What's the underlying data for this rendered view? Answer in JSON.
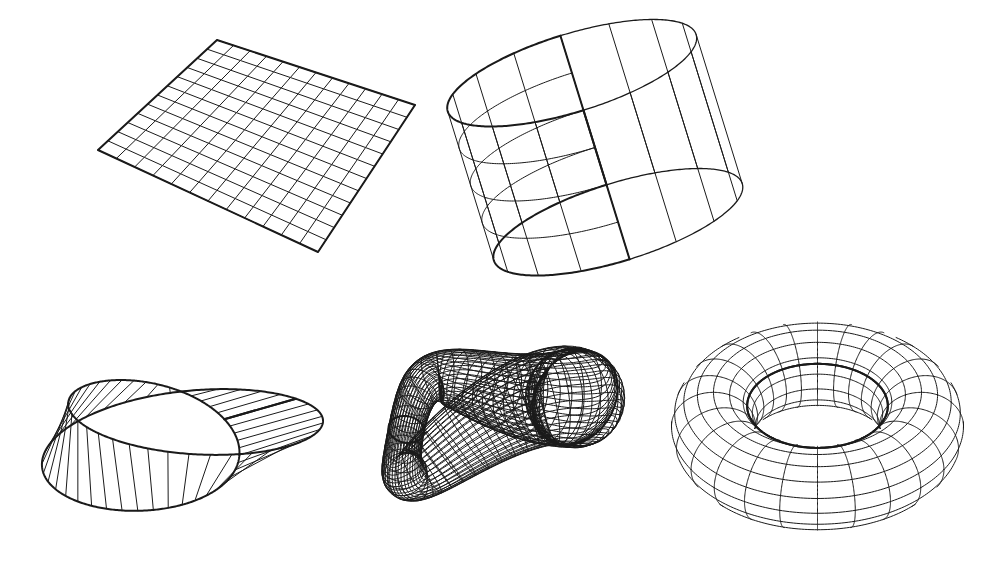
{
  "figure": {
    "background_color": "#ffffff",
    "line_color": "#1a1a1a",
    "width": 995,
    "height": 574,
    "rendering_style": "black-and-white wireframe mesh, no labels, no axes, no text"
  },
  "panels": [
    {
      "id": "plane",
      "name": "plane",
      "row": 1,
      "column": 1,
      "bounds": {
        "x": 98,
        "y": 38,
        "width": 320,
        "height": 216
      },
      "corners": [
        {
          "x": 217,
          "y": 40
        },
        {
          "x": 415,
          "y": 105
        },
        {
          "x": 318,
          "y": 252
        },
        {
          "x": 98,
          "y": 150
        }
      ],
      "mesh": {
        "u_lines": 13,
        "v_lines": 13,
        "cells_u": 12,
        "cells_v": 12
      },
      "topology": {
        "genus": 0,
        "orientable": true,
        "closed": false,
        "boundary_components": 1,
        "euler_characteristic": 1
      }
    },
    {
      "id": "cylinder",
      "name": "cylinder",
      "row": 1,
      "column": 2,
      "bounds": {
        "x": 475,
        "y": 35,
        "width": 240,
        "height": 225
      },
      "mesh": {
        "meridians": 16,
        "parallels": 4
      },
      "topology": {
        "genus": 0,
        "orientable": true,
        "closed": false,
        "boundary_components": 2,
        "euler_characteristic": 0
      }
    },
    {
      "id": "mobius-strip",
      "name": "Mobius strip",
      "row": 2,
      "column": 1,
      "bounds": {
        "x": 20,
        "y": 292,
        "width": 310,
        "height": 278
      },
      "mesh": {
        "ruling_lines": 40,
        "parallels": 0
      },
      "topology": {
        "genus": 1,
        "orientable": false,
        "closed": false,
        "boundary_components": 1,
        "euler_characteristic": 0,
        "half_twists": 1
      }
    },
    {
      "id": "klein-bottle",
      "name": "Klein bottle",
      "row": 2,
      "column": 2,
      "bounds": {
        "x": 338,
        "y": 288,
        "width": 300,
        "height": 282
      },
      "mesh": {
        "meridians": 40,
        "parallels": 24
      },
      "topology": {
        "genus": 2,
        "orientable": false,
        "closed": true,
        "boundary_components": 0,
        "euler_characteristic": 0,
        "self_intersecting": true
      }
    },
    {
      "id": "torus",
      "name": "torus",
      "row": 2,
      "column": 3,
      "bounds": {
        "x": 673,
        "y": 300,
        "width": 289,
        "height": 260
      },
      "mesh": {
        "meridians": 24,
        "parallels": 16
      },
      "topology": {
        "genus": 1,
        "orientable": true,
        "closed": true,
        "boundary_components": 0,
        "euler_characteristic": 0
      }
    }
  ]
}
